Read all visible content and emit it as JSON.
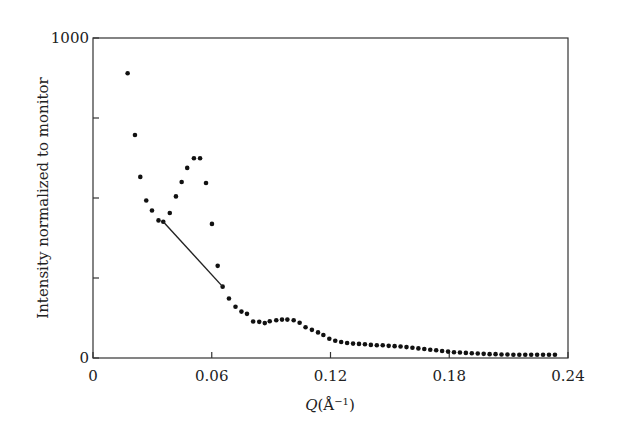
{
  "chart_data": {
    "type": "scatter",
    "title": "",
    "xlabel": "Q(Å⁻¹)",
    "xlabel_parts": {
      "italic": "Q",
      "rest": "(Å",
      "sup": "−1",
      "close": ")"
    },
    "ylabel": "Intensity normalized to monitor",
    "xlim": [
      0,
      0.24
    ],
    "ylim": [
      0,
      1000
    ],
    "xticks": [
      0,
      0.06,
      0.12,
      0.18,
      0.24
    ],
    "xtick_labels": [
      "0",
      "0.06",
      "0.12",
      "0.18",
      "0.24"
    ],
    "yticks": [
      0,
      250,
      500,
      750,
      1000
    ],
    "ytick_labels": [
      "0",
      "",
      "",
      "",
      "1000"
    ],
    "grid": false,
    "legend": null,
    "series": [
      {
        "name": "data",
        "marker": "dot",
        "x": [
          0.0175,
          0.0212,
          0.0239,
          0.0269,
          0.0298,
          0.0331,
          0.0355,
          0.0388,
          0.0419,
          0.0448,
          0.0476,
          0.051,
          0.0541,
          0.0571,
          0.0601,
          0.063,
          0.0655,
          0.0687,
          0.072,
          0.075,
          0.0778,
          0.0809,
          0.084,
          0.0868,
          0.0893,
          0.0926,
          0.0955,
          0.0982,
          0.1014,
          0.1044,
          0.1074,
          0.1106,
          0.1137,
          0.1164,
          0.1194,
          0.1224,
          0.1254,
          0.1284,
          0.1314,
          0.1344,
          0.1374,
          0.1404,
          0.1434,
          0.1464,
          0.1494,
          0.1524,
          0.1554,
          0.1584,
          0.1614,
          0.1644,
          0.1674,
          0.1704,
          0.1734,
          0.1764,
          0.1794,
          0.1824,
          0.1854,
          0.1884,
          0.1914,
          0.1944,
          0.1974,
          0.2004,
          0.2034,
          0.2064,
          0.2094,
          0.2124,
          0.2154,
          0.2184,
          0.2214,
          0.2244,
          0.2274,
          0.2304,
          0.2334
        ],
        "y": [
          890,
          697,
          566,
          492,
          461,
          430,
          426,
          453,
          505,
          550,
          594,
          624,
          624,
          547,
          419,
          288,
          223,
          186,
          160,
          145,
          138,
          114,
          113,
          109,
          115,
          118,
          120,
          120,
          118,
          110,
          96,
          88,
          80,
          72,
          60,
          54,
          50,
          47,
          45,
          44,
          43,
          41,
          40,
          40,
          38,
          37,
          36,
          34,
          32,
          30,
          28,
          26,
          24,
          22,
          20,
          18,
          17,
          16,
          15,
          14,
          13,
          12,
          12,
          11,
          11,
          10,
          10,
          10,
          10,
          10,
          10,
          10,
          10
        ]
      }
    ],
    "annotations": [
      {
        "type": "line",
        "from": [
          0.0355,
          426
        ],
        "to": [
          0.0655,
          223
        ],
        "description": "straight line joining points across the peak"
      }
    ]
  }
}
